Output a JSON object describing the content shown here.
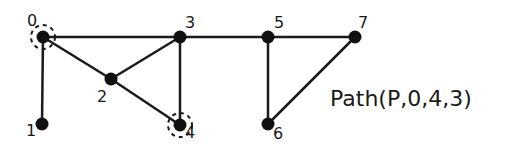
{
  "graph": {
    "nodes": [
      {
        "id": "0",
        "label": "0",
        "x": 43,
        "y": 37,
        "lx": 27,
        "ly": 26,
        "highlighted": true
      },
      {
        "id": "1",
        "label": "1",
        "x": 42,
        "y": 124,
        "lx": 26,
        "ly": 136,
        "highlighted": false
      },
      {
        "id": "2",
        "label": "2",
        "x": 111,
        "y": 79,
        "lx": 97,
        "ly": 102,
        "highlighted": false
      },
      {
        "id": "3",
        "label": "3",
        "x": 180,
        "y": 37,
        "lx": 185,
        "ly": 28,
        "highlighted": false
      },
      {
        "id": "4",
        "label": "4",
        "x": 180,
        "y": 125,
        "lx": 185,
        "ly": 138,
        "highlighted": true
      },
      {
        "id": "5",
        "label": "5",
        "x": 268,
        "y": 37,
        "lx": 274,
        "ly": 28,
        "highlighted": false
      },
      {
        "id": "6",
        "label": "6",
        "x": 268,
        "y": 124,
        "lx": 273,
        "ly": 139,
        "highlighted": false
      },
      {
        "id": "7",
        "label": "7",
        "x": 355,
        "y": 37,
        "lx": 358,
        "ly": 28,
        "highlighted": false
      }
    ],
    "edges": [
      [
        "0",
        "3"
      ],
      [
        "0",
        "1"
      ],
      [
        "0",
        "2"
      ],
      [
        "2",
        "3"
      ],
      [
        "2",
        "4"
      ],
      [
        "3",
        "4"
      ],
      [
        "3",
        "5"
      ],
      [
        "5",
        "7"
      ],
      [
        "5",
        "6"
      ],
      [
        "6",
        "7"
      ]
    ],
    "colors": {
      "node": "#111111",
      "edge": "#1a1a1a",
      "highlight": "#1a1a1a"
    }
  },
  "caption": {
    "text": "Path(P,0,4,3)"
  }
}
